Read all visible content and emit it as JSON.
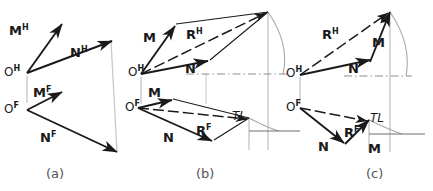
{
  "figure": {
    "colors": {
      "line": "#1a1a1a",
      "construction": "#9a9a9a",
      "background": "#ffffff",
      "caption": "#555555"
    }
  },
  "panels": [
    {
      "id": "a",
      "caption": "(a)",
      "description": "Given vectors M and N shown in horizontal (H) and frontal (F) views",
      "labels": [
        {
          "name": "vector-label-mh",
          "text": "M",
          "sup": "H"
        },
        {
          "name": "vector-label-nh",
          "text": "N",
          "sup": "H"
        },
        {
          "name": "origin-label-oh",
          "text": "O",
          "sup": "H"
        },
        {
          "name": "vector-label-mf",
          "text": "M",
          "sup": "F"
        },
        {
          "name": "origin-label-of",
          "text": "O",
          "sup": "F"
        },
        {
          "name": "vector-label-nf",
          "text": "N",
          "sup": "F"
        }
      ]
    },
    {
      "id": "b",
      "caption": "(b)",
      "description": "Parallelogram method: resultant R as diagonal of parallelogram",
      "labels": [
        {
          "name": "vector-label-m-top",
          "text": "M",
          "sup": ""
        },
        {
          "name": "resultant-label-rh",
          "text": "R",
          "sup": "H"
        },
        {
          "name": "vector-label-n-top",
          "text": "N",
          "sup": ""
        },
        {
          "name": "origin-label-oh",
          "text": "O",
          "sup": "H"
        },
        {
          "name": "vector-label-m-bottom",
          "text": "M",
          "sup": ""
        },
        {
          "name": "origin-label-of",
          "text": "O",
          "sup": "F"
        },
        {
          "name": "vector-label-n-bottom",
          "text": "N",
          "sup": ""
        },
        {
          "name": "resultant-label-rf",
          "text": "R",
          "sup": "F"
        },
        {
          "name": "true-length-label",
          "text": "TL",
          "sup": ""
        }
      ]
    },
    {
      "id": "c",
      "caption": "(c)",
      "description": "Triangle method: vectors placed head-to-tail, resultant closes triangle",
      "labels": [
        {
          "name": "resultant-label-rh",
          "text": "R",
          "sup": "H"
        },
        {
          "name": "vector-label-m-top",
          "text": "M",
          "sup": ""
        },
        {
          "name": "vector-label-n-top",
          "text": "N",
          "sup": ""
        },
        {
          "name": "origin-label-oh",
          "text": "O",
          "sup": "H"
        },
        {
          "name": "origin-label-of",
          "text": "O",
          "sup": "F"
        },
        {
          "name": "vector-label-n-bottom",
          "text": "N",
          "sup": ""
        },
        {
          "name": "resultant-label-rf",
          "text": "R",
          "sup": "F"
        },
        {
          "name": "true-length-label",
          "text": "TL",
          "sup": ""
        },
        {
          "name": "vector-label-m-bottom",
          "text": "M",
          "sup": ""
        }
      ]
    }
  ],
  "text": {
    "a_MH": "M",
    "a_MH_sup": "H",
    "a_NH": "N",
    "a_NH_sup": "H",
    "a_OH": "O",
    "a_OH_sup": "H",
    "a_MF": "M",
    "a_MF_sup": "F",
    "a_OF": "O",
    "a_OF_sup": "F",
    "a_NF": "N",
    "a_NF_sup": "F",
    "a_cap": "(a)",
    "b_M1": "M",
    "b_RH": "R",
    "b_RH_sup": "H",
    "b_N1": "N",
    "b_OH": "O",
    "b_OH_sup": "H",
    "b_M2": "M",
    "b_OF": "O",
    "b_OF_sup": "F",
    "b_N2": "N",
    "b_RF": "R",
    "b_RF_sup": "F",
    "b_TL": "TL",
    "b_cap": "(b)",
    "c_RH": "R",
    "c_RH_sup": "H",
    "c_M1": "M",
    "c_N1": "N",
    "c_OH": "O",
    "c_OH_sup": "H",
    "c_OF": "O",
    "c_OF_sup": "F",
    "c_N2": "N",
    "c_RF": "R",
    "c_RF_sup": "F",
    "c_TL": "TL",
    "c_M2": "M",
    "c_cap": "(c)"
  }
}
